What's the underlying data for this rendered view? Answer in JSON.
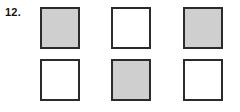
{
  "item": {
    "number_label": "12.",
    "background_color": "#ffffff"
  },
  "figure": {
    "type": "square-grid",
    "rows": 2,
    "columns": 3,
    "shaded_color": "#cfcfcf",
    "unshaded_color": "#ffffff",
    "border_color": "#2b2b2b",
    "cells": [
      [
        {
          "fill": "shaded"
        },
        {
          "fill": "white"
        },
        {
          "fill": "shaded"
        }
      ],
      [
        {
          "fill": "white"
        },
        {
          "fill": "shaded"
        },
        {
          "fill": "white"
        }
      ]
    ]
  }
}
